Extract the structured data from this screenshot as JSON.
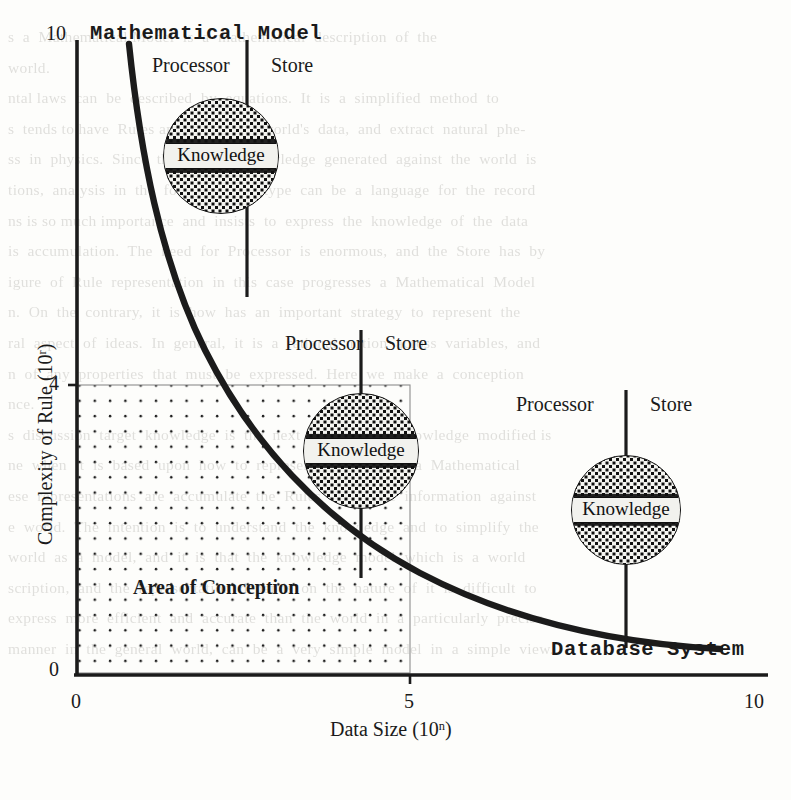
{
  "figure": {
    "axes": {
      "x": {
        "title_prefix": "Data Size (10",
        "title_exp": "n",
        "title_suffix": ")",
        "ticks": [
          "0",
          "5",
          "10"
        ],
        "range": [
          0,
          10
        ]
      },
      "y": {
        "title_prefix": "Complexity of Rule (10",
        "title_exp": "r",
        "title_suffix": ")",
        "ticks": [
          "0",
          "4",
          "10"
        ],
        "range": [
          0,
          10
        ]
      }
    },
    "region_label": "Area of Conception",
    "systems": [
      {
        "name": "Mathematical Model",
        "processor_label": "Processor",
        "store_label": "Store",
        "knowledge_label": "Knowledge",
        "x": 2.3,
        "y": 9.0
      },
      {
        "name": "",
        "processor_label": "Processor",
        "store_label": "Store",
        "knowledge_label": "Knowledge",
        "x": 4.2,
        "y": 5.1
      },
      {
        "name": "Database System",
        "processor_label": "Processor",
        "store_label": "Store",
        "knowledge_label": "Knowledge",
        "x": 7.8,
        "y": 3.4
      }
    ]
  },
  "chart_data": {
    "type": "line",
    "title": "",
    "xlabel": "Data Size (10^n)",
    "ylabel": "Complexity of Rule (10^r)",
    "xlim": [
      0,
      10
    ],
    "ylim": [
      0,
      10
    ],
    "xticks": [
      0,
      5,
      10
    ],
    "yticks": [
      0,
      4,
      10
    ],
    "grid": false,
    "series": [
      {
        "name": "complexity-vs-data-size",
        "x": [
          0.75,
          1.0,
          1.3,
          1.7,
          2.2,
          2.8,
          3.5,
          4.2,
          5.0,
          6.0,
          7.0,
          8.0,
          8.8
        ],
        "y": [
          9.7,
          8.0,
          6.4,
          5.0,
          4.0,
          3.2,
          2.6,
          2.2,
          1.9,
          1.6,
          1.4,
          1.25,
          1.15
        ]
      }
    ],
    "shaded_region": {
      "label": "Area of Conception",
      "x_range": [
        0,
        5
      ],
      "y_range": [
        0,
        4
      ],
      "fill": "dotted"
    },
    "annotations": [
      {
        "text": "Mathematical Model",
        "x": 2.3,
        "y": 10.0
      },
      {
        "text": "Database System",
        "x": 8.0,
        "y": 0.8
      },
      {
        "text": "Area of Conception",
        "x": 2.2,
        "y": 1.6
      }
    ]
  },
  "ghost_text": [
    "s  a  Mathematical Model  is  a  mathematical  description  of  the",
    "world.",
    "ntal laws  can  be  described  by  equations.  It  is  a  simplified  method  to",
    "s  tends to have  Rules and  Store  the  world's  data,  and  extract  natural  phe-",
    "ss  in  physics.  Since  the  implicit  knowledge  generated  against  the  world  is",
    "tions,  analysis  in  the  form  of  such  type  can  be  a  language  for  the  record",
    "ns is so much importance  and  insists  to  express  the  knowledge  of  the  data",
    "is  accumulation.  The  need  for  Processor  is  enormous,  and  the  Store  has  by",
    "igure  of  Rule  representation  in  this  case  progresses  a  Mathematical  Model",
    "n.  On  the  contrary,  it  is  how  has  an  important  strategy  to  represent  the",
    "ral  aspect  of  ideas.  In  general,  it  is  a  rational  notion  across  variables,  and",
    "n  of  any  properties  that  must  be  expressed.  Here  we  make  a  conception",
    "nce.",
    "s  discussion  target  knowledge  is  the  next  to  say  as  a  knowledge  modified is",
    "ne  when  it  is  based  upon  how  to  represent  any  case  as  a  Mathematical",
    "ese  representations  are  accumulate  the  Rules  and  Store  information  against",
    "e  world.  The  intention  is  to  understand  the  knowledge  and  to  simplify  the",
    "world  as  a  model,  and  it  is  that  the  knowledge  model  which  is  a  world",
    "scription,  and  the  representation  depends  on  the  nature  of  it  is  difficult  to",
    "express  more  efficient  and  accurate  than  the  world  in  a  particularly  precise",
    "manner  in  the  general  world,  can  be  a  very  simple  model  in  a  simple  view."
  ]
}
